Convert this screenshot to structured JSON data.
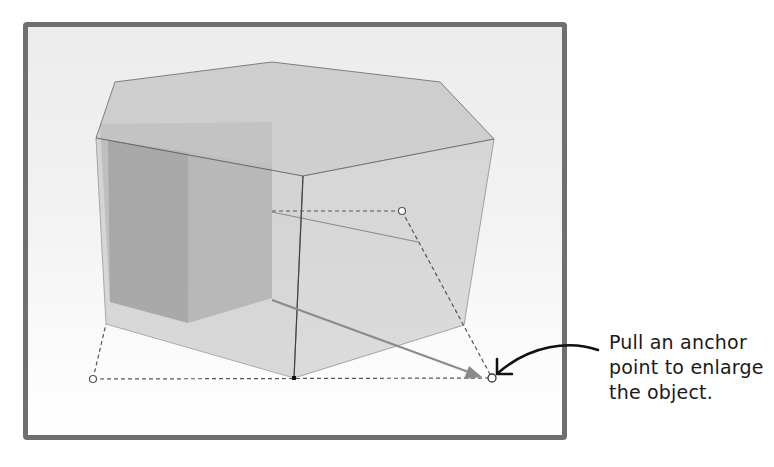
{
  "figure": {
    "object": "hexagonal-prism",
    "viewport": {
      "border_color": "#6f6f6f",
      "background_top": "#ececec",
      "background_bottom": "#ffffff"
    },
    "colors": {
      "top_face": "#c9c9c9",
      "front_face": "#cfcfcf",
      "inner_dark": "#8f8f8f",
      "edge": "#555555",
      "arrow": "#8a8a8a",
      "callout": "#111111"
    },
    "anchor_points": [
      {
        "name": "left",
        "x": 93,
        "y": 379
      },
      {
        "name": "back",
        "x": 402,
        "y": 211
      },
      {
        "name": "right",
        "x": 492,
        "y": 378
      },
      {
        "name": "front-bottom",
        "x": 294,
        "y": 378
      }
    ]
  },
  "callout": {
    "lines": [
      "Pull an anchor",
      "point to enlarge",
      "the object."
    ]
  }
}
